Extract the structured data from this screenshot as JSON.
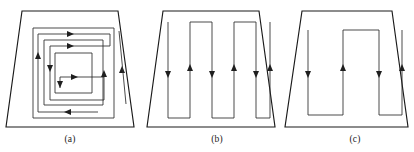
{
  "figure": {
    "background_color": "#ffffff",
    "line_color": "#1a1a1a",
    "path_color": "#2a2a2a",
    "arrow_color": "#1f1f1f",
    "panels": [
      {
        "id": "a",
        "caption": "(a)",
        "boundary_shape": "trapezoid",
        "boundary_points": "22,11 118,11 134,127 6,127",
        "path_type": "spiral-serpentine",
        "arrow_count": 8,
        "arrow_directions": [
          "right",
          "right",
          "down",
          "right",
          "down",
          "right",
          "up",
          "up"
        ]
      },
      {
        "id": "b",
        "caption": "(b)",
        "boundary_shape": "trapezoid",
        "boundary_points": "163,11 259,11 275,127 147,127",
        "path_type": "boustrophedon-vertical",
        "arrow_count": 6,
        "arrow_directions": [
          "down",
          "up",
          "down",
          "up",
          "down",
          "up"
        ]
      },
      {
        "id": "c",
        "caption": "(c)",
        "boundary_shape": "trapezoid",
        "boundary_points": "302,11 392,11 408,127 285,127",
        "path_type": "boustrophedon-vertical",
        "arrow_count": 4,
        "arrow_directions": [
          "down",
          "up",
          "down",
          "up"
        ]
      }
    ]
  }
}
